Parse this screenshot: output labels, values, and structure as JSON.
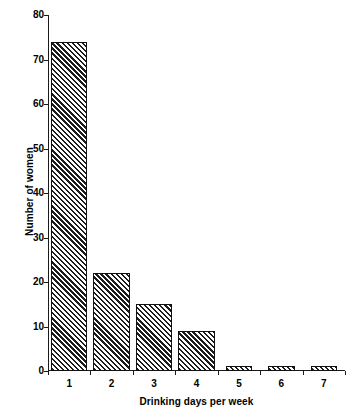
{
  "chart_data": {
    "type": "bar",
    "title": "",
    "xlabel": "Drinking days per week",
    "ylabel": "Number of women",
    "categories": [
      "1",
      "2",
      "3",
      "4",
      "5",
      "6",
      "7"
    ],
    "values": [
      74,
      22,
      15,
      9,
      1,
      1,
      1
    ],
    "ylim": [
      0,
      80
    ],
    "yticks": [
      0,
      10,
      20,
      30,
      40,
      50,
      60,
      70,
      80
    ],
    "ytick_labels": [
      "0",
      "10",
      "20",
      "30",
      "40",
      "50",
      "60",
      "70",
      "80"
    ],
    "grid": false,
    "legend": false,
    "bar_fill": "diagonal-hatch",
    "bar_edge_color": "#111111",
    "bar_face_color": "#ffffff",
    "background_color": "#ffffff",
    "axis_color": "#1a1a1a"
  }
}
